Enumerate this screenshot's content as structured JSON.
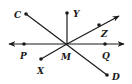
{
  "diagram": {
    "type": "geometry-lines-and-rays",
    "center": {
      "label": "M",
      "x": 67,
      "y": 44
    },
    "labels": {
      "C": "C",
      "Y": "Y",
      "Z": "Z",
      "P": "P",
      "M": "M",
      "Q": "Q",
      "X": "X",
      "D": "D"
    },
    "points": [
      {
        "name": "C",
        "x": 26,
        "y": 14
      },
      {
        "name": "Y",
        "x": 67,
        "y": 13
      },
      {
        "name": "Z",
        "x": 99,
        "y": 25
      },
      {
        "name": "P",
        "x": 24,
        "y": 44
      },
      {
        "name": "M",
        "x": 67,
        "y": 44
      },
      {
        "name": "Q",
        "x": 105,
        "y": 44
      },
      {
        "name": "X",
        "x": 41,
        "y": 59
      },
      {
        "name": "D",
        "x": 107,
        "y": 75
      }
    ],
    "segments": [
      {
        "name": "segment-CD",
        "from": "C",
        "to": "D"
      },
      {
        "name": "segment-MY",
        "from": "M",
        "to": "Y"
      },
      {
        "name": "segment-MX",
        "from": "M",
        "to": "X"
      }
    ],
    "rays": [
      {
        "name": "ray-MZ",
        "from": "M",
        "through": "Z",
        "arrow": true
      }
    ],
    "lines": [
      {
        "name": "line-PQ",
        "through": [
          "P",
          "Q"
        ],
        "arrows": "both"
      }
    ],
    "colors": {
      "stroke": "#1a1a1a",
      "background": "#ffffff"
    }
  }
}
